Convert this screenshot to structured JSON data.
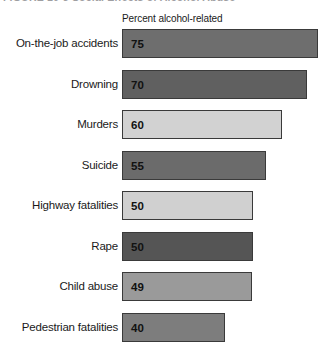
{
  "figure": {
    "title": "FIGURE 10-3   Social Effects of Alcohol Abuse",
    "column_header": "Percent alcohol-related"
  },
  "chart_data": {
    "type": "bar",
    "orientation": "horizontal",
    "title": "FIGURE 10-3   Social Effects of Alcohol Abuse",
    "xlabel": "Percent alcohol-related",
    "ylabel": "",
    "xlim": [
      0,
      75
    ],
    "grid": false,
    "legend": "none",
    "categories": [
      "On-the-job accidents",
      "Drowning",
      "Murders",
      "Suicide",
      "Highway fatalities",
      "Rape",
      "Child abuse",
      "Pedestrian fatalities"
    ],
    "values": [
      75,
      70,
      60,
      55,
      50,
      50,
      49,
      40
    ],
    "bar_colors": [
      "#6e6e6e",
      "#606060",
      "#d2d2d2",
      "#6b6b6b",
      "#d0d0d0",
      "#555555",
      "#9a9a9a",
      "#7d7d7d"
    ],
    "bar_border_color": "#3a3a3a",
    "bars": [
      {
        "label": "On-the-job accidents",
        "value": "75",
        "width_px": 196,
        "color": "#6e6e6e"
      },
      {
        "label": "Drowning",
        "value": "70",
        "width_px": 185,
        "color": "#606060"
      },
      {
        "label": "Murders",
        "value": "60",
        "width_px": 160,
        "color": "#d2d2d2"
      },
      {
        "label": "Suicide",
        "value": "55",
        "width_px": 144,
        "color": "#6b6b6b"
      },
      {
        "label": "Highway fatalities",
        "value": "50",
        "width_px": 131,
        "color": "#d0d0d0"
      },
      {
        "label": "Rape",
        "value": "50",
        "width_px": 131,
        "color": "#555555"
      },
      {
        "label": "Child abuse",
        "value": "49",
        "width_px": 130,
        "color": "#9a9a9a"
      },
      {
        "label": "Pedestrian fatalities",
        "value": "40",
        "width_px": 103,
        "color": "#7d7d7d"
      }
    ]
  }
}
